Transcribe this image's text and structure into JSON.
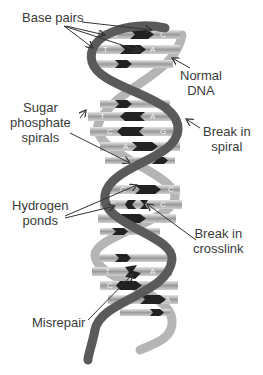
{
  "figure": {
    "title": ""
  },
  "labels": {
    "base_pairs": "Base pairs",
    "normal_dna": [
      "Normal",
      "DNA"
    ],
    "sugar_phosphate": [
      "Sugar",
      "phosphate",
      "spirals"
    ],
    "break_spiral": [
      "Break in",
      "spiral"
    ],
    "hydrogen_bonds": [
      "Hydrogen",
      "ponds"
    ],
    "break_crosslink": [
      "Break in",
      "crosslink"
    ],
    "misrepair": "Misrepair"
  },
  "bases": {
    "row1": [
      "G",
      "C"
    ],
    "row2": [
      "T",
      "A"
    ],
    "row3": [
      "T",
      "A"
    ],
    "row4": [
      "C",
      "G"
    ],
    "row5": [
      "A",
      "T"
    ],
    "row6": [
      "C",
      "C"
    ],
    "row7": [
      "C",
      "C"
    ],
    "row8": [
      "T",
      "A"
    ],
    "row9": [
      "C",
      "G"
    ],
    "row10": [
      "T",
      "A"
    ]
  },
  "colors": {
    "strand_dark": "#5a5a5a",
    "strand_light": "#b5b5b5",
    "rung_light": "#c8c8c8",
    "rung_dark": "#222222",
    "text": "#3a3a3a"
  }
}
